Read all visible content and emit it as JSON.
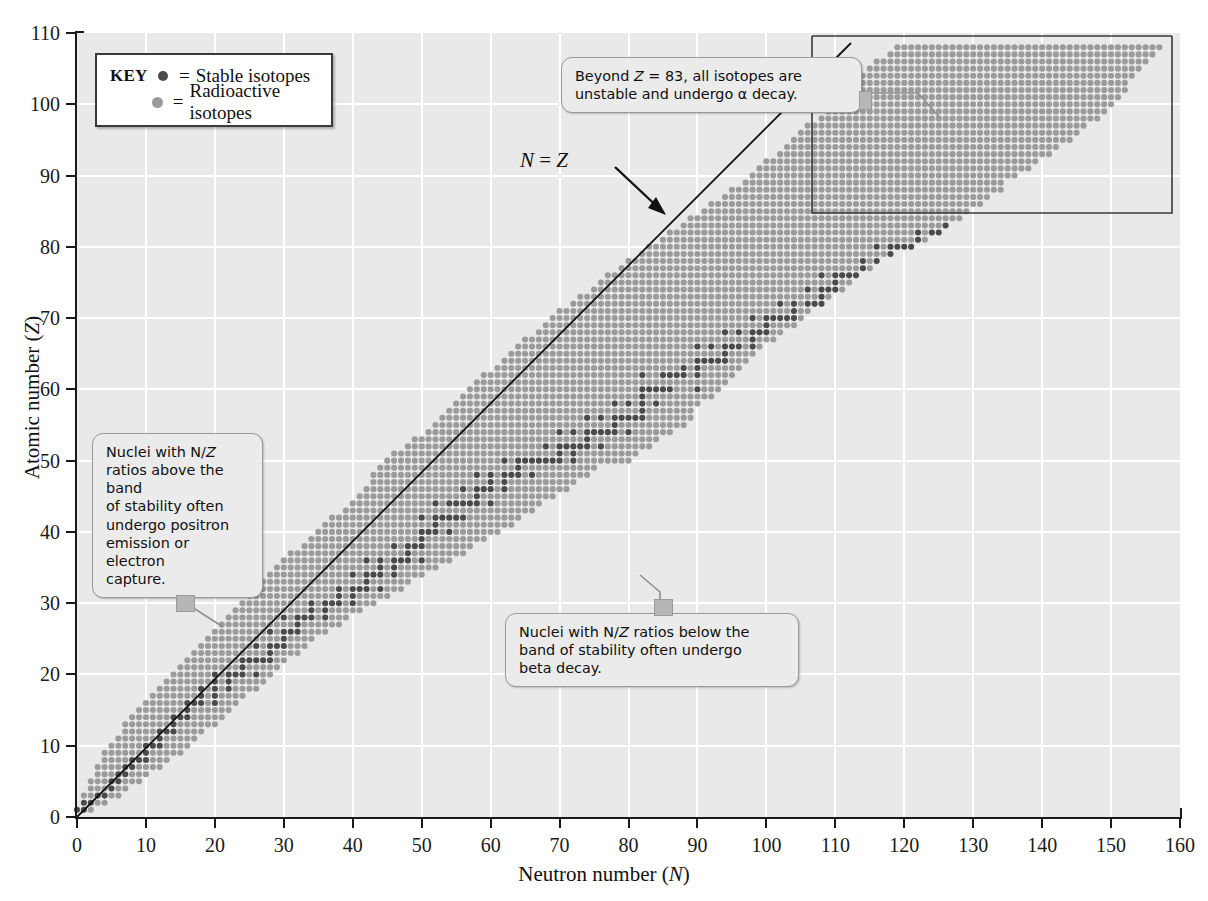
{
  "axes": {
    "xlabel": "Neutron number (N)",
    "ylabel": "Atomic number (Z)",
    "xticks": [
      0,
      10,
      20,
      30,
      40,
      50,
      60,
      70,
      80,
      90,
      100,
      110,
      120,
      130,
      140,
      150,
      160
    ],
    "yticks": [
      0,
      10,
      20,
      30,
      40,
      50,
      60,
      70,
      80,
      90,
      100,
      110
    ],
    "xlim": [
      0,
      160
    ],
    "ylim": [
      0,
      110
    ],
    "grid": true,
    "grid_color": "#ffffff",
    "plot_bg": "#e9e9e9",
    "axis_color": "#1a1a1a"
  },
  "legend": {
    "title": "KEY",
    "position": "inside-top-left",
    "entries": [
      {
        "marker": "dark-gray-circle",
        "color": "#4a4a4a",
        "eq": "=",
        "label": "Stable isotopes"
      },
      {
        "marker": "light-gray-circle",
        "color": "#9b9b9b",
        "eq": "=",
        "label": "Radioactive isotopes"
      }
    ]
  },
  "annotations": {
    "nz_line_label": "N = Z",
    "callouts": [
      {
        "id": "alpha",
        "lines": [
          "Beyond Z = 83, all isotopes are",
          "unstable and undergo α decay."
        ],
        "target": "z-greater-than-83-box"
      },
      {
        "id": "above-band",
        "lines": [
          "Nuclei with N/Z",
          "ratios above the band",
          "of stability often",
          "undergo positron",
          "emission or electron",
          "capture."
        ],
        "target": "upper-left-band-edge"
      },
      {
        "id": "below-band",
        "lines": [
          "Nuclei with N/Z ratios below the",
          "band of stability often undergo",
          "beta decay."
        ],
        "target": "lower-right-band-edge"
      }
    ]
  },
  "chart_data": {
    "type": "scatter",
    "xlabel": "Neutron number (N)",
    "ylabel": "Atomic number (Z)",
    "xlim": [
      0,
      160
    ],
    "ylim": [
      0,
      110
    ],
    "grid": true,
    "legend_position": "inside-top-left",
    "series": [
      {
        "name": "Stable isotopes",
        "color": "#4a4a4a",
        "marker": "circle"
      },
      {
        "name": "Radioactive isotopes",
        "color": "#9b9b9b",
        "marker": "circle"
      }
    ],
    "reference_line": {
      "label": "N = Z",
      "from": [
        0,
        0
      ],
      "to": [
        110,
        110
      ],
      "color": "#111111"
    },
    "highlight_box": {
      "label": "Beyond Z = 83 all isotopes unstable",
      "x_range": [
        104,
        157
      ],
      "y_range": [
        84,
        110
      ]
    },
    "stable_isotopes": {
      "description": "Z from 1 to 83 with the stable N values for each element",
      "by_Z": {
        "1": [
          0,
          1
        ],
        "2": [
          1,
          2
        ],
        "3": [
          3,
          4
        ],
        "4": [
          5
        ],
        "5": [
          5,
          6
        ],
        "6": [
          6,
          7
        ],
        "7": [
          7,
          8
        ],
        "8": [
          8,
          9,
          10
        ],
        "9": [
          10
        ],
        "10": [
          10,
          11,
          12
        ],
        "11": [
          12
        ],
        "12": [
          12,
          13,
          14
        ],
        "13": [
          14
        ],
        "14": [
          14,
          15,
          16
        ],
        "15": [
          16
        ],
        "16": [
          16,
          17,
          18,
          20
        ],
        "17": [
          18,
          20
        ],
        "18": [
          18,
          20,
          22
        ],
        "19": [
          20,
          22
        ],
        "20": [
          20,
          22,
          23,
          24,
          26
        ],
        "21": [
          24
        ],
        "22": [
          24,
          25,
          26,
          27,
          28
        ],
        "23": [
          28
        ],
        "24": [
          26,
          28,
          29,
          30
        ],
        "25": [
          30
        ],
        "26": [
          28,
          30,
          31,
          32
        ],
        "27": [
          32
        ],
        "28": [
          30,
          32,
          33,
          34,
          36
        ],
        "29": [
          34,
          36
        ],
        "30": [
          34,
          36,
          37,
          38,
          40
        ],
        "31": [
          38,
          40
        ],
        "32": [
          38,
          40,
          41,
          42,
          44
        ],
        "33": [
          42
        ],
        "34": [
          40,
          42,
          43,
          44,
          46
        ],
        "35": [
          44,
          46
        ],
        "36": [
          42,
          44,
          46,
          47,
          48,
          50
        ],
        "37": [
          48
        ],
        "38": [
          46,
          48,
          49,
          50
        ],
        "39": [
          50
        ],
        "40": [
          50,
          51,
          52,
          54
        ],
        "41": [
          52
        ],
        "42": [
          50,
          52,
          53,
          54,
          55,
          56
        ],
        "44": [
          52,
          54,
          55,
          56,
          57,
          58,
          60
        ],
        "45": [
          58
        ],
        "46": [
          56,
          58,
          59,
          60,
          62
        ],
        "47": [
          60,
          62
        ],
        "48": [
          58,
          60,
          62,
          63,
          64,
          66
        ],
        "49": [
          64
        ],
        "50": [
          62,
          64,
          65,
          66,
          67,
          68,
          69,
          70,
          72
        ],
        "51": [
          70,
          72
        ],
        "52": [
          68,
          70,
          71,
          72,
          73,
          74,
          76
        ],
        "53": [
          74
        ],
        "54": [
          70,
          72,
          74,
          75,
          76,
          77,
          78,
          80
        ],
        "55": [
          78
        ],
        "56": [
          74,
          76,
          78,
          79,
          80,
          81,
          82
        ],
        "57": [
          82
        ],
        "58": [
          78,
          80,
          82,
          84
        ],
        "59": [
          82
        ],
        "60": [
          82,
          83,
          84,
          85,
          86,
          90
        ],
        "62": [
          82,
          85,
          86,
          87,
          88,
          90
        ],
        "63": [
          88,
          90
        ],
        "64": [
          90,
          91,
          92,
          93,
          94
        ],
        "65": [
          94
        ],
        "66": [
          90,
          92,
          94,
          95,
          96,
          98
        ],
        "67": [
          98
        ],
        "68": [
          94,
          96,
          98,
          99,
          100
        ],
        "69": [
          100
        ],
        "70": [
          98,
          100,
          101,
          102,
          103,
          104
        ],
        "71": [
          104
        ],
        "72": [
          102,
          104,
          106,
          107,
          108
        ],
        "73": [
          108
        ],
        "74": [
          106,
          108,
          109,
          110
        ],
        "75": [
          110
        ],
        "76": [
          108,
          110,
          111,
          112,
          113,
          114
        ],
        "77": [
          114,
          116
        ],
        "78": [
          114,
          116,
          117,
          118,
          120
        ],
        "79": [
          118
        ],
        "80": [
          116,
          118,
          119,
          120,
          121,
          122,
          124
        ],
        "81": [
          122,
          124
        ],
        "82": [
          122,
          124,
          125,
          126
        ],
        "83": [
          126
        ]
      }
    },
    "band_outline": {
      "description": "Outer envelope of all plotted isotopes (radioactive band), Z -> [Nmin, Nmax]",
      "by_Z": {
        "1": [
          0,
          2
        ],
        "5": [
          2,
          9
        ],
        "10": [
          5,
          16
        ],
        "15": [
          9,
          22
        ],
        "20": [
          14,
          28
        ],
        "25": [
          19,
          34
        ],
        "30": [
          24,
          43
        ],
        "35": [
          29,
          52
        ],
        "40": [
          35,
          61
        ],
        "45": [
          41,
          69
        ],
        "50": [
          45,
          77
        ],
        "55": [
          52,
          85
        ],
        "60": [
          57,
          92
        ],
        "65": [
          63,
          98
        ],
        "70": [
          69,
          105
        ],
        "75": [
          76,
          112
        ],
        "80": [
          83,
          119
        ],
        "85": [
          91,
          128
        ],
        "90": [
          98,
          136
        ],
        "95": [
          104,
          144
        ],
        "100": [
          110,
          150
        ],
        "105": [
          115,
          154
        ],
        "108": [
          119,
          157
        ]
      }
    }
  }
}
